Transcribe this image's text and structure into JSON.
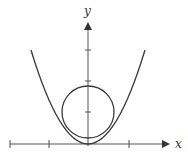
{
  "diagram": {
    "title": "",
    "x_axis_label": "x",
    "y_axis_label": "y",
    "colors": {
      "stroke": "#3a3a3a",
      "background": "#ffffff"
    },
    "elements": [
      {
        "type": "parabola",
        "description": "upward-opening parabola with vertex at origin"
      },
      {
        "type": "circle",
        "description": "circle centered on y-axis, tangent to the parabola on both sides"
      }
    ],
    "x_ticks": 4,
    "y_ticks": 3
  }
}
